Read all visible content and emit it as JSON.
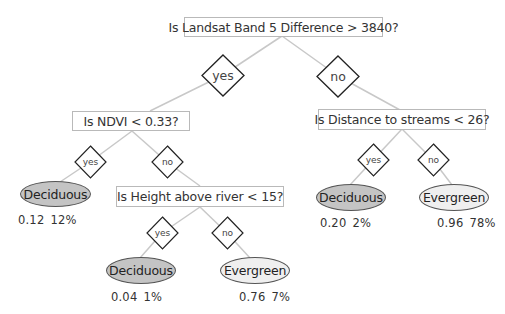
{
  "diagram": {
    "type": "decision-tree",
    "colors": {
      "deciduous_fill": "#c4c4c4",
      "evergreen_fill": "#efefef",
      "edge": "#c8c8c8",
      "box_border": "#b9b9b9"
    },
    "root": {
      "question": "Is Landsat Band 5 Difference > 3840?"
    },
    "branch_labels": {
      "root_yes": "yes",
      "root_no": "no",
      "ndvi_yes": "yes",
      "ndvi_no": "no",
      "height_yes": "yes",
      "height_no": "no",
      "distance_yes": "yes",
      "distance_no": "no"
    },
    "nodes": {
      "ndvi": {
        "question": "Is NDVI < 0.33?"
      },
      "height": {
        "question": "Is Height above river < 15?"
      },
      "distance": {
        "question": "Is Distance to streams < 26?"
      }
    },
    "leaves": {
      "ndvi_yes": {
        "label": "Deciduous",
        "prob": "0.12",
        "pct": "12%"
      },
      "height_yes": {
        "label": "Deciduous",
        "prob": "0.04",
        "pct": "1%"
      },
      "height_no": {
        "label": "Evergreen",
        "prob": "0.76",
        "pct": "7%"
      },
      "distance_yes": {
        "label": "Deciduous",
        "prob": "0.20",
        "pct": "2%"
      },
      "distance_no": {
        "label": "Evergreen",
        "prob": "0.96",
        "pct": "78%"
      }
    }
  }
}
